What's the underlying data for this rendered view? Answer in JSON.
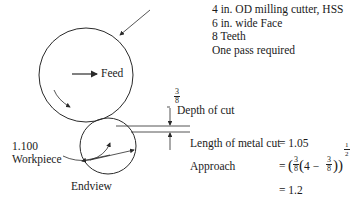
{
  "specs": {
    "line1": "4 in. OD milling cutter, HSS",
    "line2": "6 in. wide Face",
    "line3": "8 Teeth",
    "line4": "One pass required"
  },
  "labels": {
    "feed": "Feed",
    "depth_of_cut": "Depth of cut",
    "depth_num": "3",
    "depth_den": "8",
    "workpiece_dim": "1.100",
    "workpiece": "Workpiece",
    "endview": "Endview"
  },
  "equations": {
    "length_label": "Length of metal cut",
    "length_eq": "= 1.05",
    "approach_label": "Approach",
    "approach_eq_prefix": "=",
    "approach_frac1_num": "3",
    "approach_frac1_den": "8",
    "approach_inner": "4 −",
    "approach_frac2_num": "3",
    "approach_frac2_den": "8",
    "approach_exp_num": "1",
    "approach_exp_den": "2",
    "approach_result": "= 1.2"
  },
  "colors": {
    "line": "#2a2a2a",
    "text": "#1a1a1a",
    "background": "#ffffff"
  }
}
